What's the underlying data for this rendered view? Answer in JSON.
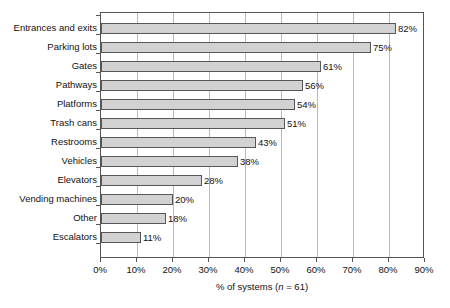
{
  "chart_data": {
    "type": "bar",
    "orientation": "horizontal",
    "title": "",
    "xlabel": "% of systems (n = 61)",
    "ylabel": "",
    "xlim": [
      0,
      90
    ],
    "grid": true,
    "legend": null,
    "categories": [
      "Entrances and exits",
      "Parking lots",
      "Gates",
      "Pathways",
      "Platforms",
      "Trash cans",
      "Restrooms",
      "Vehicles",
      "Elevators",
      "Vending machines",
      "Other",
      "Escalators"
    ],
    "values": [
      82,
      75,
      61,
      56,
      54,
      51,
      43,
      38,
      28,
      20,
      18,
      11
    ],
    "value_labels": [
      "82%",
      "75%",
      "61%",
      "56%",
      "54%",
      "51%",
      "43%",
      "38%",
      "28%",
      "20%",
      "18%",
      "11%"
    ],
    "xticks": [
      0,
      10,
      20,
      30,
      40,
      50,
      60,
      70,
      80,
      90
    ],
    "xtick_labels": [
      "0%",
      "10%",
      "20%",
      "30%",
      "40%",
      "50%",
      "60%",
      "70%",
      "80%",
      "90%"
    ],
    "axis_title_parts": {
      "prefix": "% of systems (",
      "italic": "n",
      "suffix": " = 61)"
    },
    "colors": {
      "bar_fill": "#d2d2d2",
      "bar_border": "#575757",
      "gridline": "#b9b9b9",
      "frame": "#555555",
      "text": "#121212",
      "background": "#ffffff"
    }
  }
}
